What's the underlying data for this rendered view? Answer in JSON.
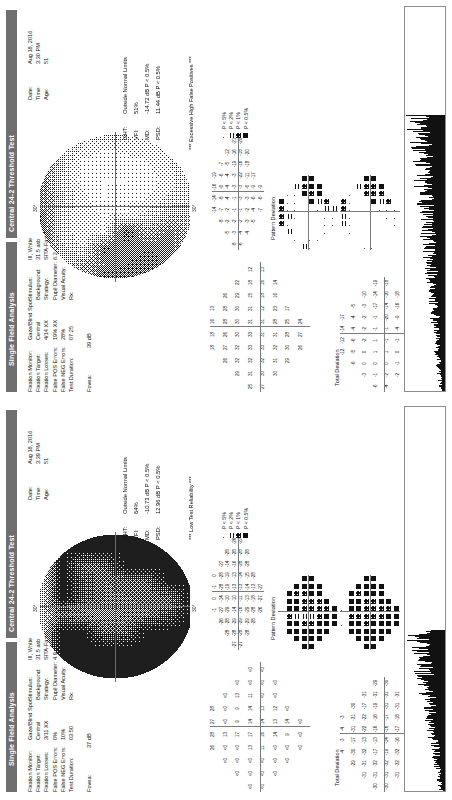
{
  "document": {
    "report_type": "Single Field Analysis",
    "test_title": "Central 24-2 Threshold Test"
  },
  "panels": [
    {
      "eye": "OS",
      "header_left": "Single Field Analysis",
      "header_right": "Central 24-2 Threshold Test",
      "reliability": {
        "col1_header": "Gaze/Blind Spot",
        "fixation_monitor_label": "Fixation Monitor:",
        "fixation_monitor_value": "Gaze/Blind Spot",
        "fixation_target_label": "Fixation Target:",
        "fixation_target_value": "Central",
        "fixation_losses_label": "Fixation Losses:",
        "fixation_losses_value": "3/11 XX",
        "false_pos_label": "False POS Errors:",
        "false_pos_value": "0%",
        "false_neg_label": "False NEG Errors:",
        "false_neg_value": "10%",
        "test_duration_label": "Test Duration:",
        "test_duration_value": "03:50",
        "foveal_label": "Fovea:",
        "foveal_value": "37 dB"
      },
      "stimulus": {
        "stimulus_label": "Stimulus:",
        "stimulus_value": "III, White",
        "background_label": "Background:",
        "background_value": "31.5 asb",
        "strategy_label": "Strategy:",
        "strategy_value": "SITA-Fast",
        "pupil_label": "Pupil Diameter:",
        "pupil_value": "4.9 mm",
        "acuity_label": "Visual Acuity:",
        "acuity_value": "",
        "rx_label": "Rx:",
        "rx_value": "+2.75 DS"
      },
      "patient": {
        "date_label": "Date:",
        "date_value": "Aug 18, 2016",
        "time_label": "Time:",
        "time_value": "3:39 PM",
        "age_label": "Age:",
        "age_value": "51"
      },
      "indices": {
        "ght_label": "GHT:",
        "ght_value": "Outside Normal Limits",
        "vfi_label": "VFI:",
        "vfi_value": "64%",
        "md_label": "MD:",
        "md_value": "-10.73 dB  P < 0.5%",
        "psd_label": "PSD:",
        "psd_value": "12.96 dB  P < 0.5%"
      },
      "note": "*** Low Test Reliability ***",
      "total_deviation_label": "Total Deviation",
      "pattern_deviation_label": "Pattern Deviation",
      "axis_label_top": "30°",
      "axis_label_bottom": "30°",
      "axis_label_left": "30°",
      "thresholds": [
        [
          null,
          null,
          null,
          "26",
          "28",
          "27",
          "28",
          null,
          null,
          null
        ],
        [
          null,
          null,
          "<0",
          "<0",
          "13",
          "<0",
          "<0",
          "<0",
          null,
          null
        ],
        [
          null,
          "<0",
          "<0",
          "<0",
          "17",
          "9",
          "9",
          "13",
          "<0",
          null
        ],
        [
          "<0",
          "<0",
          "<0",
          "13",
          "17",
          "14",
          "14",
          "11",
          "<0",
          "<0"
        ],
        [
          "<0",
          "<0",
          "<0",
          "11",
          "16",
          "14",
          "13",
          "<0",
          "<0",
          "<0"
        ],
        [
          null,
          "<0",
          "<0",
          "<0",
          "14",
          "13",
          "12",
          "<0",
          "<0",
          null
        ],
        [
          null,
          null,
          "<0",
          "<0",
          "9",
          "14",
          "<0",
          null,
          null,
          null
        ],
        [
          null,
          null,
          null,
          "<0",
          "<0",
          "<0",
          null,
          null,
          null,
          null
        ]
      ],
      "total_deviation": [
        [
          null,
          null,
          null,
          "-4",
          "-3",
          "-4",
          "-3",
          null,
          null,
          null
        ],
        [
          null,
          null,
          "-29",
          "-30",
          "-17",
          "-31",
          "-31",
          "-30",
          null,
          null
        ],
        [
          null,
          "-31",
          "-31",
          "-32",
          "-13",
          "-22",
          "-22",
          "-17",
          "-31",
          null
        ],
        [
          "-30",
          "-31",
          "-32",
          "-17",
          "-13",
          "-16",
          "-16",
          "-19",
          "-31",
          "-29"
        ],
        [
          "-30",
          "-31",
          "-32",
          "-19",
          "-14",
          "-16",
          "-17",
          "-31",
          "-31",
          "-30"
        ],
        [
          null,
          "-31",
          "-32",
          "-32",
          "-16",
          "-17",
          "-18",
          "-31",
          "-31",
          null
        ],
        [
          null,
          null,
          "-31",
          "-31",
          "-21",
          "-16",
          "-31",
          null,
          null,
          null
        ],
        [
          null,
          null,
          null,
          "-29",
          "-30",
          "-30",
          null,
          null,
          null,
          null
        ]
      ],
      "pattern_deviation": [
        [
          null,
          null,
          null,
          "-1",
          "0",
          "-1",
          "0",
          null,
          null,
          null
        ],
        [
          null,
          null,
          "-26",
          "-27",
          "-14",
          "-28",
          "-28",
          "-27",
          null,
          null
        ],
        [
          null,
          "-28",
          "-28",
          "-29",
          "-10",
          "-19",
          "-19",
          "-14",
          "-28",
          null
        ],
        [
          "-27",
          "-28",
          "-29",
          "-14",
          "-10",
          "-13",
          "-13",
          "-16",
          "-28",
          "-26"
        ],
        [
          "-27",
          "-28",
          "-29",
          "-16",
          "-11",
          "-13",
          "-14",
          "-28",
          "-28",
          "-27"
        ],
        [
          null,
          "-28",
          "-29",
          "-29",
          "-13",
          "-14",
          "-15",
          "-28",
          "-28",
          null
        ],
        [
          null,
          null,
          "-28",
          "-28",
          "-18",
          "-13",
          "-28",
          null,
          null,
          null
        ],
        [
          null,
          null,
          null,
          "-26",
          "-27",
          "-27",
          null,
          null,
          null,
          null
        ]
      ]
    },
    {
      "eye": "OD",
      "header_left": "Single Field Analysis",
      "header_right": "Central 24-2 Threshold Test",
      "reliability": {
        "col1_header": "Gaze/Blind Spot",
        "fixation_monitor_label": "Fixation Monitor:",
        "fixation_monitor_value": "Gaze/Blind Spot",
        "fixation_target_label": "Fixation Target:",
        "fixation_target_value": "Central",
        "fixation_losses_label": "Fixation Losses:",
        "fixation_losses_value": "4/14 XX",
        "false_pos_label": "False POS Errors:",
        "false_pos_value": "19% XX",
        "false_neg_label": "False NEG Errors:",
        "false_neg_value": "28%",
        "test_duration_label": "Test Duration:",
        "test_duration_value": "07:25",
        "foveal_label": "Fovea:",
        "foveal_value": "39 dB"
      },
      "stimulus": {
        "stimulus_label": "Stimulus:",
        "stimulus_value": "III, White",
        "background_label": "Background:",
        "background_value": "31.5 asb",
        "strategy_label": "Strategy:",
        "strategy_value": "SITA-Fast",
        "pupil_label": "Pupil Diameter:",
        "pupil_value": "6.2 mm",
        "acuity_label": "Visual Acuity:",
        "acuity_value": "",
        "rx_label": "Rx:",
        "rx_value": "+3.25 DS"
      },
      "patient": {
        "date_label": "Date:",
        "date_value": "Aug 18, 2016",
        "time_label": "Time:",
        "time_value": "3:30 PM",
        "age_label": "Age:",
        "age_value": "51"
      },
      "indices": {
        "ght_label": "GHT:",
        "ght_value": "Outside Normal Limits",
        "vfi_label": "VFI:",
        "vfi_value": "51%",
        "md_label": "MD:",
        "md_value": "-14.72 dB  P < 0.5%",
        "psd_label": "PSD:",
        "psd_value": "11.44 dB  P < 0.5%"
      },
      "note": "*** Excessive High False Positives ***",
      "total_deviation_label": "Total Deviation",
      "pattern_deviation_label": "Pattern Deviation",
      "axis_label_top": "30°",
      "axis_label_bottom": "30°",
      "axis_label_left": "30°",
      "thresholds": [
        [
          null,
          null,
          null,
          "18",
          "18",
          "16",
          "13",
          null,
          null,
          null
        ],
        [
          null,
          null,
          "26",
          "27",
          "26",
          "28",
          "28",
          "26",
          null,
          null
        ],
        [
          null,
          "29",
          "32",
          "32",
          "30",
          "30",
          "30",
          "29",
          "22",
          null
        ],
        [
          "25",
          "31",
          "32",
          "33",
          "33",
          "31",
          "31",
          "15",
          "18",
          "12"
        ],
        [
          "27",
          "30",
          "32",
          "33",
          "31",
          "31",
          "12",
          "18",
          "16",
          "13"
        ],
        [
          null,
          "30",
          "31",
          "32",
          "31",
          "28",
          "23",
          "16",
          "14",
          null
        ],
        [
          null,
          null,
          "29",
          "30",
          "28",
          "25",
          "17",
          null,
          null,
          null
        ],
        [
          null,
          null,
          null,
          "26",
          "27",
          "24",
          null,
          null,
          null,
          null
        ]
      ],
      "total_deviation": [
        [
          null,
          null,
          null,
          "-12",
          "-12",
          "-14",
          "-17",
          null,
          null,
          null
        ],
        [
          null,
          null,
          "-6",
          "-5",
          "-6",
          "-4",
          "-4",
          "-5",
          null,
          null
        ],
        [
          null,
          "-3",
          "0",
          "0",
          "-2",
          "-2",
          "-2",
          "-3",
          "-10",
          null
        ],
        [
          "-6",
          "-1",
          "0",
          "1",
          "1",
          "-1",
          "-1",
          "-17",
          "-14",
          "-19"
        ],
        [
          "-4",
          "-2",
          "0",
          "1",
          "-1",
          "-1",
          "-20",
          "-14",
          "-16",
          "-18"
        ],
        [
          null,
          "-2",
          "-1",
          "0",
          "-1",
          "-4",
          "-9",
          "-16",
          "-18",
          null
        ],
        [
          null,
          null,
          "-3",
          "-2",
          "-4",
          "-7",
          "-15",
          null,
          null,
          null
        ],
        [
          null,
          null,
          null,
          "-5",
          "-4",
          "-7",
          null,
          null,
          null,
          null
        ]
      ],
      "pattern_deviation": [
        [
          null,
          null,
          null,
          "-14",
          "-14",
          "-16",
          "-19",
          null,
          null,
          null
        ],
        [
          null,
          null,
          "-8",
          "-7",
          "-8",
          "-6",
          "-6",
          "-7",
          null,
          null
        ],
        [
          null,
          "-5",
          "-2",
          "-2",
          "-4",
          "-4",
          "-4",
          "-5",
          "-12",
          null
        ],
        [
          "-8",
          "-3",
          "-2",
          "-1",
          "-1",
          "-3",
          "-3",
          "-19",
          "-16",
          "-21"
        ],
        [
          "-6",
          "-4",
          "-2",
          "-1",
          "-3",
          "-3",
          "-22",
          "-16",
          "-18",
          "-20"
        ],
        [
          null,
          "-4",
          "-3",
          "-2",
          "-3",
          "-6",
          "-11",
          "-18",
          "-20",
          null
        ],
        [
          null,
          null,
          "-5",
          "-4",
          "-6",
          "-9",
          "-17",
          null,
          null,
          null
        ],
        [
          null,
          null,
          null,
          "-7",
          "-6",
          "-9",
          null,
          null,
          null,
          null
        ]
      ]
    }
  ],
  "legend": {
    "items": [
      {
        "symbol": "dot",
        "label": "P < 5%"
      },
      {
        "symbol": "hatch-light",
        "label": "P < 2%"
      },
      {
        "symbol": "hatch-dense",
        "label": "P < 1%"
      },
      {
        "symbol": "solid",
        "label": "P < 0.5%"
      }
    ]
  }
}
